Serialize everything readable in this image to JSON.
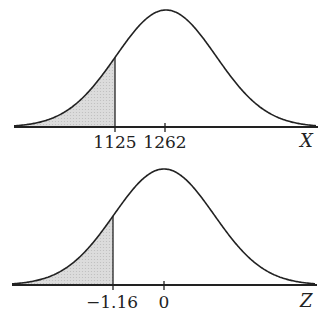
{
  "chart_data": [
    {
      "type": "area",
      "title": "",
      "xlabel": "X",
      "ylabel": "",
      "distribution": "normal",
      "mean": 1262,
      "shaded_region": "left tail below 1125",
      "tick_labels": [
        "1125",
        "1262"
      ],
      "ticks": [
        1125,
        1262
      ]
    },
    {
      "type": "area",
      "title": "",
      "xlabel": "Z",
      "ylabel": "",
      "distribution": "standard normal",
      "mean": 0,
      "shaded_region": "left tail below -1.16",
      "tick_labels": [
        "−1.16",
        "0"
      ],
      "ticks": [
        -1.16,
        0
      ]
    }
  ],
  "top": {
    "cut_label": "1125",
    "mean_label": "1262",
    "axis_label": "X"
  },
  "bottom": {
    "cut_label": "−1.16",
    "mean_label": "0",
    "axis_label": "Z"
  },
  "colors": {
    "line": "#222222",
    "shade": "#d9d9d9"
  }
}
